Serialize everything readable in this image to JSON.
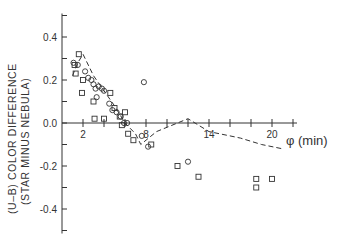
{
  "chart_data": {
    "type": "scatter",
    "title": "",
    "xlabel": "φ (min)",
    "ylabel": "(U–B) COLOR DIFFERENCE (STAR MINUS NEBULA)",
    "ylabel_line1": "(U–B) COLOR DIFFERENCE",
    "ylabel_line2": "(STAR MINUS NEBULA)",
    "xlim": [
      0,
      22
    ],
    "ylim": [
      -0.5,
      0.5
    ],
    "x_ticks": [
      2,
      4,
      6,
      8,
      10,
      12,
      14,
      16,
      18,
      20,
      22
    ],
    "x_tick_labels": [
      {
        "x": 2,
        "label": "2"
      },
      {
        "x": 8,
        "label": "8"
      },
      {
        "x": 14,
        "label": "14"
      },
      {
        "x": 20,
        "label": "20"
      }
    ],
    "y_ticks": [
      -0.5,
      -0.4,
      -0.3,
      -0.2,
      -0.1,
      0.0,
      0.1,
      0.2,
      0.3,
      0.4,
      0.5
    ],
    "y_tick_labels": [
      {
        "y": 0.4,
        "label": "0.4"
      },
      {
        "y": 0.2,
        "label": "0.2"
      },
      {
        "y": 0.0,
        "label": "0.0"
      },
      {
        "y": -0.2,
        "label": "-0.2"
      },
      {
        "y": -0.4,
        "label": "-0.4"
      }
    ],
    "grid": false,
    "legend": "none",
    "series": [
      {
        "name": "squares",
        "marker": "square",
        "points": [
          [
            1.2,
            0.27
          ],
          [
            1.3,
            0.23
          ],
          [
            1.6,
            0.32
          ],
          [
            1.9,
            0.14
          ],
          [
            2.0,
            0.2
          ],
          [
            3.0,
            0.1
          ],
          [
            3.1,
            0.02
          ],
          [
            4.0,
            0.02
          ],
          [
            4.6,
            0.14
          ],
          [
            5.0,
            0.07
          ],
          [
            5.5,
            0.03
          ],
          [
            5.7,
            -0.01
          ],
          [
            6.0,
            0.05
          ],
          [
            6.3,
            -0.05
          ],
          [
            6.8,
            -0.08
          ],
          [
            8.5,
            -0.1
          ],
          [
            11.0,
            -0.2
          ],
          [
            13.0,
            -0.25
          ],
          [
            18.5,
            -0.26
          ],
          [
            18.5,
            -0.3
          ],
          [
            20.0,
            -0.26
          ]
        ]
      },
      {
        "name": "circles",
        "marker": "circle",
        "points": [
          [
            1.1,
            0.28
          ],
          [
            1.5,
            0.27
          ],
          [
            2.2,
            0.24
          ],
          [
            2.5,
            0.21
          ],
          [
            2.8,
            0.2
          ],
          [
            3.0,
            0.18
          ],
          [
            3.2,
            0.16
          ],
          [
            3.5,
            0.17
          ],
          [
            3.8,
            0.16
          ],
          [
            4.0,
            0.15
          ],
          [
            3.3,
            0.12
          ],
          [
            4.5,
            0.09
          ],
          [
            4.8,
            0.06
          ],
          [
            5.2,
            0.05
          ],
          [
            5.6,
            0.03
          ],
          [
            5.9,
            0.0
          ],
          [
            6.2,
            0.0
          ],
          [
            7.8,
            0.19
          ],
          [
            7.6,
            -0.06
          ],
          [
            8.2,
            -0.11
          ],
          [
            12.0,
            -0.18
          ]
        ]
      },
      {
        "name": "dashed-curve",
        "marker": "none",
        "line_style": "dashed",
        "points": [
          [
            1.0,
            0.22
          ],
          [
            1.5,
            0.28
          ],
          [
            2.0,
            0.32
          ],
          [
            3.0,
            0.22
          ],
          [
            4.0,
            0.15
          ],
          [
            5.0,
            0.08
          ],
          [
            6.0,
            0.0
          ],
          [
            7.0,
            -0.05
          ],
          [
            7.5,
            -0.1
          ],
          [
            8.0,
            -0.08
          ],
          [
            9.0,
            -0.04
          ],
          [
            10.0,
            -0.02
          ],
          [
            11.0,
            0.0
          ],
          [
            12.0,
            0.02
          ],
          [
            14.0,
            -0.04
          ],
          [
            16.0,
            -0.06
          ],
          [
            17.0,
            -0.07
          ],
          [
            19.0,
            -0.1
          ],
          [
            21.0,
            -0.12
          ]
        ]
      }
    ]
  }
}
